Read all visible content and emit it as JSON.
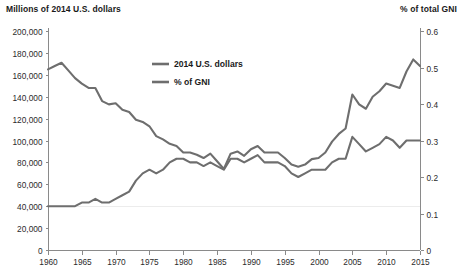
{
  "axes": {
    "left_title": "Millions of 2014 U.S. dollars",
    "right_title": "% of total GNI"
  },
  "legend": {
    "items": [
      {
        "label": "2014 U.S. dollars"
      },
      {
        "label": "% of GNI"
      }
    ]
  },
  "colors": {
    "series_line": "#6e6e6e",
    "axis": "#8a8a8a",
    "gridline": "#ececec",
    "text": "#1a1a1a",
    "background": "#ffffff"
  },
  "chart_data": {
    "type": "line",
    "title": "",
    "subtitle": "",
    "xlabel": "",
    "ylabel": "Millions of 2014 U.S. dollars",
    "y2label": "% of total GNI",
    "grid": "single faint horizontal gridline at 0.1 / 40,000 level",
    "legend_position": "upper-center-left",
    "xlim": [
      1960,
      2015
    ],
    "ylim": [
      0,
      200000
    ],
    "y2lim": [
      0,
      0.6
    ],
    "xticks": [
      1960,
      1965,
      1970,
      1975,
      1980,
      1985,
      1990,
      1995,
      2000,
      2005,
      2010,
      2015
    ],
    "xtick_labels": [
      "1960",
      "1965",
      "1970",
      "1975",
      "1980",
      "1985",
      "1990",
      "1995",
      "2000",
      "2005",
      "2010",
      "2015"
    ],
    "yticks": [
      0,
      20000,
      40000,
      60000,
      80000,
      100000,
      120000,
      140000,
      160000,
      180000,
      200000
    ],
    "ytick_labels": [
      "0",
      "20,000",
      "40,000",
      "60,000",
      "80,000",
      "100,000",
      "120,000",
      "140,000",
      "160,000",
      "180,000",
      "200,000"
    ],
    "y2ticks": [
      0,
      0.1,
      0.2,
      0.3,
      0.4,
      0.5,
      0.6
    ],
    "y2tick_labels": [
      "0",
      "0.1",
      "0.2",
      "0.3",
      "0.4",
      "0.5",
      "0.6"
    ],
    "x": [
      1960,
      1961,
      1962,
      1963,
      1964,
      1965,
      1966,
      1967,
      1968,
      1969,
      1970,
      1971,
      1972,
      1973,
      1974,
      1975,
      1976,
      1977,
      1978,
      1979,
      1980,
      1981,
      1982,
      1983,
      1984,
      1985,
      1986,
      1987,
      1988,
      1989,
      1990,
      1991,
      1992,
      1993,
      1994,
      1995,
      1996,
      1997,
      1998,
      1999,
      2000,
      2001,
      2002,
      2003,
      2004,
      2005,
      2006,
      2007,
      2008,
      2009,
      2010,
      2011,
      2012,
      2013,
      2014,
      2015
    ],
    "series": [
      {
        "name": "2014 U.S. dollars",
        "axis": "left",
        "values": [
          165000,
          168000,
          171000,
          164000,
          157000,
          152000,
          148000,
          148000,
          136000,
          133000,
          134000,
          128000,
          126000,
          119000,
          117000,
          113000,
          104000,
          101000,
          97000,
          95000,
          89000,
          89000,
          87000,
          84000,
          88000,
          81000,
          74000,
          88000,
          90000,
          86000,
          92000,
          95000,
          89000,
          89000,
          89000,
          84000,
          78000,
          76000,
          78000,
          83000,
          84000,
          89000,
          99000,
          106000,
          111000,
          142000,
          133000,
          129000,
          140000,
          145000,
          152000,
          150000,
          148000,
          163000,
          174000,
          168000
        ]
      },
      {
        "name": "% of GNI",
        "axis": "right",
        "values": [
          0.12,
          0.12,
          0.12,
          0.12,
          0.12,
          0.13,
          0.13,
          0.14,
          0.13,
          0.13,
          0.14,
          0.15,
          0.16,
          0.19,
          0.21,
          0.22,
          0.21,
          0.22,
          0.24,
          0.25,
          0.25,
          0.24,
          0.24,
          0.23,
          0.24,
          0.23,
          0.22,
          0.25,
          0.25,
          0.24,
          0.25,
          0.26,
          0.24,
          0.24,
          0.24,
          0.23,
          0.21,
          0.2,
          0.21,
          0.22,
          0.22,
          0.22,
          0.24,
          0.25,
          0.25,
          0.31,
          0.29,
          0.27,
          0.28,
          0.29,
          0.31,
          0.3,
          0.28,
          0.3,
          0.3,
          0.3
        ]
      }
    ]
  }
}
